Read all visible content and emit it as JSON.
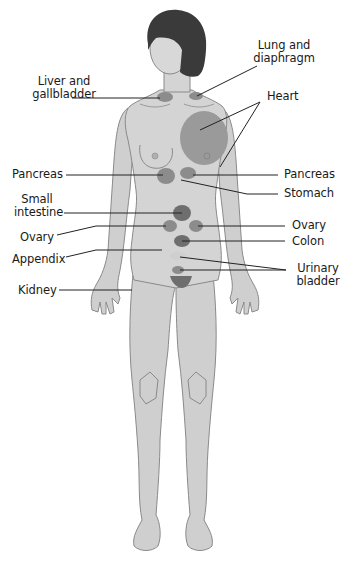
{
  "figure": {
    "type": "anatomical referred-pain diagram (front view, female figure)",
    "background": "#ffffff",
    "colors": {
      "skin": "#cfcfcf",
      "skin_light": "#dedede",
      "outline": "#8a8a8a",
      "hair": "#3a3a3a",
      "organ_zone": "#8c8c8c",
      "organ_zone_dark": "#6e6e6e",
      "heart_zone": "#9a9a9a",
      "leader_line": "#222222",
      "text": "#1a1a1a"
    }
  },
  "labels": {
    "liver_gallbladder": "Liver and\ngallbladder",
    "lung_diaphragm": "Lung and\ndiaphragm",
    "heart": "Heart",
    "pancreas_left": "Pancreas",
    "pancreas_right": "Pancreas",
    "stomach": "Stomach",
    "small_intestine": "Small\nintestine",
    "ovary_left": "Ovary",
    "ovary_right": "Ovary",
    "colon": "Colon",
    "appendix": "Appendix",
    "urinary_bladder": "Urinary\nbladder",
    "kidney": "Kidney"
  },
  "label_positions": [
    {
      "key": "liver_gallbladder",
      "x": 32,
      "y": 75,
      "align": "center",
      "w": 64
    },
    {
      "key": "lung_diaphragm",
      "x": 252,
      "y": 39,
      "align": "center",
      "w": 64
    },
    {
      "key": "heart",
      "x": 267,
      "y": 90,
      "align": "left",
      "w": 40
    },
    {
      "key": "pancreas_left",
      "x": 12,
      "y": 168,
      "align": "left",
      "w": 60
    },
    {
      "key": "pancreas_right",
      "x": 284,
      "y": 168,
      "align": "left",
      "w": 60
    },
    {
      "key": "stomach",
      "x": 284,
      "y": 187,
      "align": "left",
      "w": 60
    },
    {
      "key": "small_intestine",
      "x": 14,
      "y": 193,
      "align": "center",
      "w": 46
    },
    {
      "key": "ovary_left",
      "x": 20,
      "y": 231,
      "align": "left",
      "w": 40
    },
    {
      "key": "ovary_right",
      "x": 292,
      "y": 219,
      "align": "left",
      "w": 40
    },
    {
      "key": "colon",
      "x": 292,
      "y": 235,
      "align": "left",
      "w": 40
    },
    {
      "key": "appendix",
      "x": 12,
      "y": 253,
      "align": "left",
      "w": 60
    },
    {
      "key": "urinary_bladder",
      "x": 296,
      "y": 262,
      "align": "center",
      "w": 44
    },
    {
      "key": "kidney",
      "x": 18,
      "y": 284,
      "align": "left",
      "w": 50
    }
  ],
  "leader_lines": [
    {
      "for": "liver_gallbladder",
      "points": [
        [
          72,
          98
        ],
        [
          160,
          98
        ]
      ]
    },
    {
      "for": "lung_diaphragm",
      "points": [
        [
          257,
          66
        ],
        [
          197,
          96
        ]
      ]
    },
    {
      "for": "heart",
      "points": [
        [
          260,
          102
        ],
        [
          200,
          130
        ]
      ]
    },
    {
      "for": "heart",
      "points": [
        [
          260,
          102
        ],
        [
          220,
          167
        ]
      ]
    },
    {
      "for": "pancreas_left",
      "points": [
        [
          66,
          175
        ],
        [
          163,
          175
        ]
      ]
    },
    {
      "for": "pancreas_right",
      "points": [
        [
          278,
          175
        ],
        [
          193,
          175
        ]
      ]
    },
    {
      "for": "stomach",
      "points": [
        [
          278,
          194
        ],
        [
          247,
          194
        ],
        [
          181,
          180
        ]
      ]
    },
    {
      "for": "small_intestine",
      "points": [
        [
          64,
          213
        ],
        [
          182,
          213
        ]
      ]
    },
    {
      "for": "ovary_left",
      "points": [
        [
          57,
          235
        ],
        [
          96,
          226
        ],
        [
          166,
          226
        ]
      ]
    },
    {
      "for": "ovary_right",
      "points": [
        [
          285,
          226
        ],
        [
          198,
          226
        ]
      ]
    },
    {
      "for": "colon",
      "points": [
        [
          285,
          241
        ],
        [
          182,
          241
        ]
      ]
    },
    {
      "for": "appendix",
      "points": [
        [
          66,
          257
        ],
        [
          96,
          250
        ],
        [
          162,
          250
        ]
      ]
    },
    {
      "for": "urinary_bladder",
      "points": [
        [
          286,
          270
        ],
        [
          180,
          257
        ]
      ]
    },
    {
      "for": "urinary_bladder",
      "points": [
        [
          286,
          270
        ],
        [
          180,
          270
        ]
      ]
    },
    {
      "for": "kidney",
      "points": [
        [
          59,
          290
        ],
        [
          132,
          290
        ]
      ]
    }
  ],
  "organ_zones": [
    {
      "name": "liver-gallbladder-zone",
      "cx": 165,
      "cy": 97,
      "rx": 8,
      "ry": 5,
      "shade": "organ_zone"
    },
    {
      "name": "lung-diaphragm-zone",
      "cx": 196,
      "cy": 96,
      "rx": 7,
      "ry": 4,
      "shade": "organ_zone"
    },
    {
      "name": "heart-zone",
      "cx": 204,
      "cy": 138,
      "rx": 24,
      "ry": 27,
      "shade": "heart_zone"
    },
    {
      "name": "pancreas-left-zone",
      "cx": 166,
      "cy": 176,
      "rx": 9,
      "ry": 8,
      "shade": "organ_zone"
    },
    {
      "name": "pancreas-right-zone",
      "cx": 188,
      "cy": 173,
      "rx": 8,
      "ry": 6,
      "shade": "organ_zone"
    },
    {
      "name": "small-intestine-zone",
      "cx": 182,
      "cy": 213,
      "rx": 9,
      "ry": 8,
      "shade": "organ_zone_dark"
    },
    {
      "name": "ovary-left-zone",
      "cx": 170,
      "cy": 226,
      "rx": 7,
      "ry": 6,
      "shade": "organ_zone"
    },
    {
      "name": "ovary-right-zone",
      "cx": 196,
      "cy": 226,
      "rx": 7,
      "ry": 6,
      "shade": "organ_zone"
    },
    {
      "name": "colon-zone",
      "cx": 182,
      "cy": 241,
      "rx": 8,
      "ry": 6,
      "shade": "organ_zone_dark"
    },
    {
      "name": "appendix-zone",
      "cx": 178,
      "cy": 256,
      "rx": 8,
      "ry": 4,
      "shade": "skin"
    },
    {
      "name": "urinary-bladder-zone",
      "cx": 178,
      "cy": 270,
      "rx": 6,
      "ry": 4,
      "shade": "organ_zone"
    }
  ],
  "caption": {
    "visible": "partially cut off at bottom edge; text illegible",
    "text": ""
  }
}
